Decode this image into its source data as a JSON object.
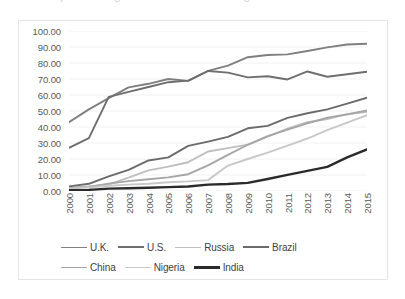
{
  "title_sliver": "percentage of individuals using the internet",
  "chart_data": {
    "type": "line",
    "title": "",
    "subtitle": "",
    "xlabel": "",
    "ylabel": "",
    "x": [
      2000,
      2001,
      2002,
      2003,
      2004,
      2005,
      2006,
      2007,
      2008,
      2009,
      2010,
      2011,
      2012,
      2013,
      2014,
      2015
    ],
    "categories": [
      "2000",
      "2001",
      "2002",
      "2003",
      "2004",
      "2005",
      "2006",
      "2007",
      "2008",
      "2009",
      "2010",
      "2011",
      "2012",
      "2013",
      "2014",
      "2015"
    ],
    "ylim": [
      0,
      100
    ],
    "ytick_labels": [
      "0.00",
      "10.00",
      "20.00",
      "30.00",
      "40.00",
      "50.00",
      "60.00",
      "70.00",
      "80.00",
      "90.00",
      "100.00"
    ],
    "ytick_values": [
      0,
      10,
      20,
      30,
      40,
      50,
      60,
      70,
      80,
      90,
      100
    ],
    "grid": true,
    "grid_axis": "y",
    "legend_position": "bottom",
    "series": [
      {
        "name": "U.K.",
        "color": "#7f7f7f",
        "width": 1.9,
        "values": [
          43.0,
          51.0,
          58.0,
          64.8,
          67.0,
          70.0,
          68.8,
          75.1,
          78.4,
          83.6,
          85.0,
          85.4,
          87.5,
          89.8,
          91.6,
          92.0
        ]
      },
      {
        "name": "U.S.",
        "color": "#6e6e6e",
        "width": 1.9,
        "values": [
          27.0,
          33.1,
          58.8,
          62.0,
          65.0,
          68.0,
          69.0,
          75.0,
          74.0,
          71.0,
          71.7,
          69.7,
          74.7,
          71.4,
          73.0,
          74.5
        ]
      },
      {
        "name": "Russia",
        "color": "#bfbfbf",
        "width": 1.9,
        "values": [
          2.0,
          2.9,
          4.1,
          8.3,
          12.9,
          15.2,
          18.0,
          24.7,
          26.8,
          29.0,
          34.0,
          39.0,
          43.0,
          45.0,
          48.0,
          49.5
        ]
      },
      {
        "name": "Brazil",
        "color": "#6b6b6b",
        "width": 1.9,
        "values": [
          2.9,
          4.5,
          9.1,
          13.2,
          19.1,
          21.0,
          28.2,
          30.9,
          33.8,
          39.2,
          40.7,
          45.7,
          48.6,
          51.0,
          54.6,
          58.3
        ]
      },
      {
        "name": "China",
        "color": "#a6a6a6",
        "width": 1.9,
        "values": [
          1.8,
          2.6,
          4.6,
          6.2,
          7.3,
          8.5,
          10.5,
          16.0,
          22.6,
          28.9,
          34.3,
          38.3,
          42.3,
          45.8,
          47.9,
          50.3
        ]
      },
      {
        "name": "Nigeria",
        "color": "#c8c8c8",
        "width": 1.9,
        "values": [
          1.5,
          2.2,
          3.3,
          4.0,
          4.5,
          5.5,
          6.0,
          6.8,
          15.9,
          20.0,
          24.0,
          28.4,
          32.8,
          38.0,
          42.7,
          47.4
        ]
      },
      {
        "name": "India",
        "color": "#2b2b2b",
        "width": 2.4,
        "values": [
          0.5,
          0.7,
          1.5,
          1.7,
          2.0,
          2.4,
          2.8,
          4.0,
          4.4,
          5.1,
          7.5,
          10.1,
          12.6,
          15.1,
          21.0,
          26.0
        ]
      }
    ]
  },
  "legend": {
    "rows": [
      [
        {
          "label": "U.K.",
          "color": "#7f7f7f",
          "width": 1.9
        },
        {
          "label": "U.S.",
          "color": "#6e6e6e",
          "width": 2.3
        },
        {
          "label": "Russia",
          "color": "#bfbfbf",
          "width": 1.9
        },
        {
          "label": "Brazil",
          "color": "#6b6b6b",
          "width": 2.3
        }
      ],
      [
        {
          "label": "China",
          "color": "#a6a6a6",
          "width": 1.9
        },
        {
          "label": "Nigeria",
          "color": "#c8c8c8",
          "width": 1.9
        },
        {
          "label": "India",
          "color": "#2b2b2b",
          "width": 3.0
        }
      ]
    ]
  }
}
